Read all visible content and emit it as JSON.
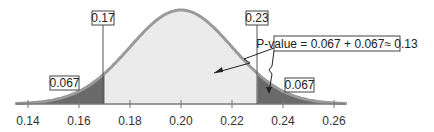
{
  "chart_data": {
    "type": "area",
    "title": "",
    "xlabel": "",
    "ylabel": "",
    "distribution": "normal",
    "mean": 0.2,
    "sd": 0.02,
    "xlim": [
      0.135,
      0.265
    ],
    "x_ticks": [
      "0.14",
      "0.16",
      "0.18",
      "0.20",
      "0.22",
      "0.24",
      "0.26"
    ],
    "tick_values": [
      0.14,
      0.16,
      0.18,
      0.2,
      0.22,
      0.24,
      0.26
    ],
    "shaded_regions": [
      {
        "name": "left tail",
        "from": 0.135,
        "to": 0.17,
        "area": 0.067
      },
      {
        "name": "right tail",
        "from": 0.23,
        "to": 0.265,
        "area": 0.067
      }
    ],
    "cutoffs": [
      0.17,
      0.23
    ],
    "annotations": [
      {
        "text": "0.17",
        "x": 0.17
      },
      {
        "text": "0.23",
        "x": 0.23
      },
      {
        "text": "0.067",
        "target": "left tail"
      },
      {
        "text": "0.067",
        "target": "right tail"
      },
      {
        "text": "P-value = 0.067 + 0.067≈ 0.13",
        "target": "both tails"
      }
    ],
    "colors": {
      "curve": "#9a9a9a",
      "body_fill": "#ebebeb",
      "tail_fill": "#6a6a6a",
      "axis": "#777777"
    },
    "grid": false,
    "legend": "none"
  },
  "labels": {
    "left_cut": "0.17",
    "right_cut": "0.23",
    "left_tail": "0.067",
    "right_tail": "0.067",
    "pvalue": "P-value = 0.067 + 0.067≈ 0.13"
  }
}
